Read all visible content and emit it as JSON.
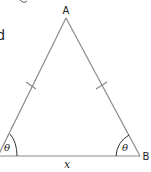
{
  "figure": {
    "type": "isosceles-triangle",
    "vertices": {
      "apex": {
        "label": "A",
        "x": 66,
        "y": 18
      },
      "left": {
        "label": "",
        "x": -2,
        "y": 156
      },
      "right": {
        "label": "B",
        "x": 140,
        "y": 156
      }
    },
    "base_label": "x",
    "angle_label": "θ",
    "angle_left_label": "θ",
    "angle_right_label": "θ",
    "equal_side_ticks": 2,
    "stroke_color": "#8a8a8a",
    "text_color": "#222222"
  },
  "clipped_text": {
    "left_fragment": "d",
    "top_fragment": "_"
  }
}
